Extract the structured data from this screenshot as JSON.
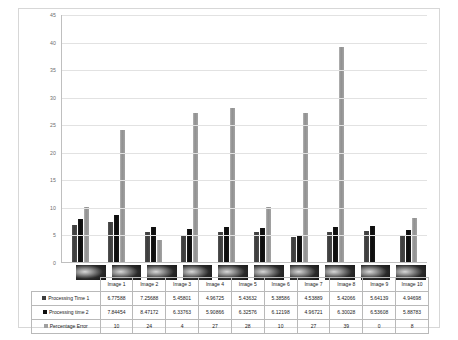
{
  "chart_data": {
    "type": "bar",
    "title": "",
    "subtitle": "",
    "xlabel": "",
    "ylabel": "",
    "ylim": [
      0,
      45
    ],
    "yticks": [
      45,
      40,
      35,
      30,
      25,
      20,
      15,
      10,
      5,
      0
    ],
    "grid": true,
    "legend_position": "data-table",
    "categories": [
      "Image 1",
      "Image 2",
      "Image 3",
      "Image 4",
      "Image 5",
      "Image 6",
      "Image 7",
      "Image 8",
      "Image 9",
      "Image 10"
    ],
    "series": [
      {
        "name": "Processing Time 1",
        "color": "#3d3d3d",
        "values": [
          6.77588,
          7.25688,
          5.45801,
          4.96725,
          5.43632,
          5.38586,
          4.53889,
          5.42066,
          5.64139,
          4.94698
        ],
        "labels": [
          "6.77588",
          "7.25688",
          "5.45801",
          "4.96725",
          "5.43632",
          "5.38586",
          "4.53889",
          "5.42066",
          "5.64139",
          "4.94698"
        ]
      },
      {
        "name": "Processing time 2",
        "color": "#0d0d0d",
        "values": [
          7.84454,
          8.47172,
          6.33763,
          5.90866,
          6.32576,
          6.12198,
          4.96721,
          6.30028,
          6.53608,
          5.88783
        ],
        "labels": [
          "7.84454",
          "8.47172",
          "6.33763",
          "5.90866",
          "6.32576",
          "6.12198",
          "4.96721",
          "6.30028",
          "6.53608",
          "5.88783"
        ]
      },
      {
        "name": "Percentage Error",
        "color": "#a0a0a0",
        "values": [
          10,
          24,
          4,
          27,
          28,
          10,
          27,
          39,
          0,
          8
        ],
        "labels": [
          "10",
          "24",
          "4",
          "27",
          "28",
          "10",
          "27",
          "39",
          "0",
          "8"
        ]
      }
    ]
  },
  "table": {
    "corner_label": "",
    "column_headers": [
      "Image 1",
      "Image 2",
      "Image 3",
      "Image 4",
      "Image 5",
      "Image 6",
      "Image 7",
      "Image 8",
      "Image 9",
      "Image 10"
    ],
    "rows": [
      {
        "label": "Processing Time 1",
        "key_class": "s0",
        "values": [
          "6.77588",
          "7.25688",
          "5.45801",
          "4.96725",
          "5.43632",
          "5.38586",
          "4.53889",
          "5.42066",
          "5.64139",
          "4.94698"
        ]
      },
      {
        "label": "Processing time 2",
        "key_class": "s1",
        "values": [
          "7.84454",
          "8.47172",
          "6.33763",
          "5.90866",
          "6.32576",
          "6.12198",
          "4.96721",
          "6.30028",
          "6.53608",
          "5.88783"
        ]
      },
      {
        "label": "Percentage Error",
        "key_class": "s2",
        "values": [
          "10",
          "24",
          "4",
          "27",
          "28",
          "10",
          "27",
          "39",
          "0",
          "8"
        ]
      }
    ]
  }
}
